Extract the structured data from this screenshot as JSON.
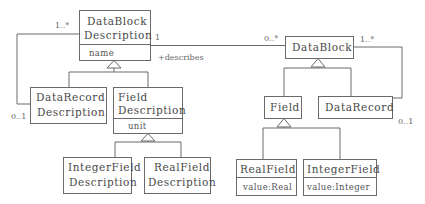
{
  "diagram": {
    "type": "UML class diagram",
    "left": {
      "datablock_description": {
        "name_line1": "DataBlock",
        "name_line2": "Description",
        "attribute": "name"
      },
      "datarecord_description": {
        "name_line1": "DataRecord",
        "name_line2": "Description"
      },
      "field_description": {
        "name_line1": "Field",
        "name_line2": "Description",
        "attribute": "unit"
      },
      "integerfield_description": {
        "name_line1": "IntegerField",
        "name_line2": "Description"
      },
      "realfield_description": {
        "name_line1": "RealField",
        "name_line2": "Description"
      },
      "self_association": {
        "mult_top": "1..*",
        "mult_bottom": "0..1"
      }
    },
    "association": {
      "source_multiplicity": "1",
      "role": "+describes",
      "target_multiplicity": "0..*"
    },
    "right": {
      "datablock": {
        "name": "DataBlock"
      },
      "field": {
        "name": "Field"
      },
      "datarecord": {
        "name": "DataRecord"
      },
      "realfield": {
        "name": "RealField",
        "attribute": "value:Real"
      },
      "integerfield": {
        "name": "IntegerField",
        "attribute": "value:Integer"
      },
      "self_association": {
        "mult_top": "1..*",
        "mult_bottom": "0..1"
      }
    },
    "colors": {
      "stroke": "#6a6a6a",
      "text": "#4a4a4a",
      "background": "#ffffff"
    }
  }
}
